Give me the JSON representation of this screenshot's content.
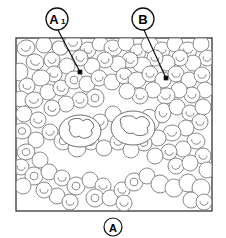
{
  "figure": {
    "type": "scientific-illustration",
    "background_color": "#ffffff",
    "cell_outline_color": "#808080",
    "frame_color": "#222222",
    "label_color": "#000000",
    "frame": {
      "x": 16,
      "y": 38,
      "width": 196,
      "height": 173,
      "stroke_width": 1.2
    }
  },
  "labels": {
    "top_left": {
      "name": "A1",
      "text": "A",
      "subscript": "1",
      "circle": {
        "cx": 57,
        "cy": 19,
        "r": 11
      },
      "leader": {
        "x1": 58,
        "y1": 30,
        "x2": 80,
        "y2": 72
      },
      "dot": {
        "cx": 80,
        "cy": 72,
        "r": 1.8
      }
    },
    "top_right": {
      "name": "B",
      "text": "B",
      "subscript": "",
      "circle": {
        "cx": 143,
        "cy": 19,
        "r": 11
      },
      "leader": {
        "x1": 144,
        "y1": 30,
        "x2": 166,
        "y2": 78
      },
      "dot": {
        "cx": 166,
        "cy": 78,
        "r": 1.8
      }
    },
    "bottom_center": {
      "name": "A",
      "text": "A",
      "subscript": "",
      "circle": {
        "cx": 113,
        "cy": 227,
        "r": 9
      },
      "leader": null,
      "dot": null
    }
  },
  "cells": {
    "erythrocytes": [
      {
        "cx": 26,
        "cy": 48,
        "rx": 9,
        "ry": 8,
        "rot": -12,
        "pallor": "arc"
      },
      {
        "cx": 44,
        "cy": 45,
        "rx": 8,
        "ry": 8,
        "rot": 5,
        "pallor": "none"
      },
      {
        "cx": 35,
        "cy": 62,
        "rx": 9,
        "ry": 8,
        "rot": 18,
        "pallor": "arc"
      },
      {
        "cx": 20,
        "cy": 72,
        "rx": 8,
        "ry": 9,
        "rot": 0,
        "pallor": "none"
      },
      {
        "cx": 52,
        "cy": 60,
        "rx": 8,
        "ry": 8,
        "rot": -8,
        "pallor": "arc"
      },
      {
        "cx": 60,
        "cy": 48,
        "rx": 8,
        "ry": 7,
        "rot": 22,
        "pallor": "none"
      },
      {
        "cx": 73,
        "cy": 43,
        "rx": 9,
        "ry": 8,
        "rot": -5,
        "pallor": "arc"
      },
      {
        "cx": 88,
        "cy": 50,
        "rx": 8,
        "ry": 8,
        "rot": 12,
        "pallor": "arc"
      },
      {
        "cx": 100,
        "cy": 44,
        "rx": 8,
        "ry": 7,
        "rot": -15,
        "pallor": "none"
      },
      {
        "cx": 113,
        "cy": 48,
        "rx": 9,
        "ry": 8,
        "rot": 8,
        "pallor": "arc"
      },
      {
        "cx": 126,
        "cy": 43,
        "rx": 8,
        "ry": 8,
        "rot": 0,
        "pallor": "none"
      },
      {
        "cx": 138,
        "cy": 52,
        "rx": 8,
        "ry": 8,
        "rot": -10,
        "pallor": "arc"
      },
      {
        "cx": 150,
        "cy": 45,
        "rx": 9,
        "ry": 8,
        "rot": 15,
        "pallor": "none"
      },
      {
        "cx": 162,
        "cy": 50,
        "rx": 8,
        "ry": 8,
        "rot": 4,
        "pallor": "arc"
      },
      {
        "cx": 175,
        "cy": 44,
        "rx": 8,
        "ry": 8,
        "rot": -6,
        "pallor": "none"
      },
      {
        "cx": 188,
        "cy": 50,
        "rx": 9,
        "ry": 8,
        "rot": 10,
        "pallor": "arc"
      },
      {
        "cx": 201,
        "cy": 44,
        "rx": 8,
        "ry": 8,
        "rot": 0,
        "pallor": "none"
      },
      {
        "cx": 207,
        "cy": 58,
        "rx": 8,
        "ry": 8,
        "rot": 12,
        "pallor": "arc"
      },
      {
        "cx": 193,
        "cy": 63,
        "rx": 8,
        "ry": 8,
        "rot": -9,
        "pallor": "none"
      },
      {
        "cx": 180,
        "cy": 58,
        "rx": 8,
        "ry": 8,
        "rot": 6,
        "pallor": "arc"
      },
      {
        "cx": 167,
        "cy": 63,
        "rx": 8,
        "ry": 8,
        "rot": -14,
        "pallor": "none"
      },
      {
        "cx": 155,
        "cy": 58,
        "rx": 8,
        "ry": 8,
        "rot": 3,
        "pallor": "arc"
      },
      {
        "cx": 142,
        "cy": 65,
        "rx": 9,
        "ry": 8,
        "rot": -4,
        "pallor": "none"
      },
      {
        "cx": 130,
        "cy": 60,
        "rx": 8,
        "ry": 8,
        "rot": 16,
        "pallor": "arc"
      },
      {
        "cx": 118,
        "cy": 64,
        "rx": 8,
        "ry": 8,
        "rot": 0,
        "pallor": "none"
      },
      {
        "cx": 105,
        "cy": 60,
        "rx": 8,
        "ry": 8,
        "rot": -11,
        "pallor": "arc"
      },
      {
        "cx": 92,
        "cy": 66,
        "rx": 8,
        "ry": 8,
        "rot": 7,
        "pallor": "none"
      },
      {
        "cx": 80,
        "cy": 58,
        "rx": 8,
        "ry": 8,
        "rot": 20,
        "pallor": "arc"
      },
      {
        "cx": 67,
        "cy": 66,
        "rx": 8,
        "ry": 8,
        "rot": -3,
        "pallor": "none"
      },
      {
        "cx": 54,
        "cy": 74,
        "rx": 8,
        "ry": 8,
        "rot": 9,
        "pallor": "arc"
      },
      {
        "cx": 41,
        "cy": 78,
        "rx": 9,
        "ry": 8,
        "rot": -7,
        "pallor": "none"
      },
      {
        "cx": 27,
        "cy": 86,
        "rx": 8,
        "ry": 8,
        "rot": 14,
        "pallor": "arc"
      },
      {
        "cx": 21,
        "cy": 99,
        "rx": 8,
        "ry": 8,
        "rot": 0,
        "pallor": "none"
      },
      {
        "cx": 34,
        "cy": 100,
        "rx": 9,
        "ry": 8,
        "rot": -12,
        "pallor": "arc"
      },
      {
        "cx": 48,
        "cy": 92,
        "rx": 8,
        "ry": 8,
        "rot": 5,
        "pallor": "none"
      },
      {
        "cx": 61,
        "cy": 88,
        "rx": 8,
        "ry": 8,
        "rot": 18,
        "pallor": "arc"
      },
      {
        "cx": 74,
        "cy": 80,
        "rx": 9,
        "ry": 9,
        "rot": -5,
        "pallor": "ring"
      },
      {
        "cx": 87,
        "cy": 84,
        "rx": 8,
        "ry": 8,
        "rot": 11,
        "pallor": "none"
      },
      {
        "cx": 99,
        "cy": 78,
        "rx": 8,
        "ry": 8,
        "rot": -9,
        "pallor": "arc"
      },
      {
        "cx": 112,
        "cy": 82,
        "rx": 8,
        "ry": 8,
        "rot": 2,
        "pallor": "none"
      },
      {
        "cx": 124,
        "cy": 76,
        "rx": 8,
        "ry": 8,
        "rot": 15,
        "pallor": "arc"
      },
      {
        "cx": 137,
        "cy": 80,
        "rx": 9,
        "ry": 8,
        "rot": -6,
        "pallor": "none"
      },
      {
        "cx": 150,
        "cy": 74,
        "rx": 8,
        "ry": 8,
        "rot": 8,
        "pallor": "arc"
      },
      {
        "cx": 163,
        "cy": 80,
        "rx": 8,
        "ry": 8,
        "rot": -13,
        "pallor": "none"
      },
      {
        "cx": 176,
        "cy": 74,
        "rx": 8,
        "ry": 8,
        "rot": 4,
        "pallor": "arc"
      },
      {
        "cx": 189,
        "cy": 80,
        "rx": 8,
        "ry": 8,
        "rot": 17,
        "pallor": "none"
      },
      {
        "cx": 202,
        "cy": 75,
        "rx": 8,
        "ry": 8,
        "rot": -2,
        "pallor": "arc"
      },
      {
        "cx": 205,
        "cy": 90,
        "rx": 8,
        "ry": 8,
        "rot": 10,
        "pallor": "none"
      },
      {
        "cx": 192,
        "cy": 95,
        "rx": 8,
        "ry": 8,
        "rot": -8,
        "pallor": "arc"
      },
      {
        "cx": 179,
        "cy": 90,
        "rx": 8,
        "ry": 8,
        "rot": 6,
        "pallor": "none"
      },
      {
        "cx": 166,
        "cy": 96,
        "rx": 9,
        "ry": 8,
        "rot": -15,
        "pallor": "arc"
      },
      {
        "cx": 153,
        "cy": 90,
        "rx": 8,
        "ry": 8,
        "rot": 3,
        "pallor": "none"
      },
      {
        "cx": 140,
        "cy": 96,
        "rx": 8,
        "ry": 8,
        "rot": 12,
        "pallor": "arc"
      },
      {
        "cx": 127,
        "cy": 91,
        "rx": 8,
        "ry": 8,
        "rot": -4,
        "pallor": "none"
      },
      {
        "cx": 95,
        "cy": 98,
        "rx": 9,
        "ry": 9,
        "rot": 7,
        "pallor": "ring"
      },
      {
        "cx": 80,
        "cy": 100,
        "rx": 8,
        "ry": 8,
        "rot": -10,
        "pallor": "arc"
      },
      {
        "cx": 66,
        "cy": 104,
        "rx": 8,
        "ry": 8,
        "rot": 5,
        "pallor": "none"
      },
      {
        "cx": 52,
        "cy": 108,
        "rx": 8,
        "ry": 8,
        "rot": 19,
        "pallor": "arc"
      },
      {
        "cx": 24,
        "cy": 114,
        "rx": 8,
        "ry": 8,
        "rot": -6,
        "pallor": "none"
      },
      {
        "cx": 38,
        "cy": 120,
        "rx": 8,
        "ry": 8,
        "rot": 9,
        "pallor": "arc"
      },
      {
        "cx": 22,
        "cy": 131,
        "rx": 9,
        "ry": 8,
        "rot": 0,
        "pallor": "ring"
      },
      {
        "cx": 36,
        "cy": 140,
        "rx": 8,
        "ry": 8,
        "rot": 13,
        "pallor": "none"
      },
      {
        "cx": 50,
        "cy": 132,
        "rx": 8,
        "ry": 8,
        "rot": -7,
        "pallor": "arc"
      },
      {
        "cx": 63,
        "cy": 141,
        "rx": 9,
        "ry": 9,
        "rot": 4,
        "pallor": "ring"
      },
      {
        "cx": 77,
        "cy": 148,
        "rx": 9,
        "ry": 9,
        "rot": -11,
        "pallor": "none"
      },
      {
        "cx": 91,
        "cy": 142,
        "rx": 8,
        "ry": 8,
        "rot": 6,
        "pallor": "arc"
      },
      {
        "cx": 104,
        "cy": 148,
        "rx": 8,
        "ry": 8,
        "rot": 16,
        "pallor": "none"
      },
      {
        "cx": 118,
        "cy": 142,
        "rx": 8,
        "ry": 8,
        "rot": -3,
        "pallor": "arc"
      },
      {
        "cx": 150,
        "cy": 120,
        "rx": 9,
        "ry": 11,
        "rot": -20,
        "pallor": "none"
      },
      {
        "cx": 163,
        "cy": 113,
        "rx": 8,
        "ry": 10,
        "rot": 12,
        "pallor": "arc"
      },
      {
        "cx": 177,
        "cy": 107,
        "rx": 8,
        "ry": 8,
        "rot": -5,
        "pallor": "none"
      },
      {
        "cx": 190,
        "cy": 113,
        "rx": 8,
        "ry": 8,
        "rot": 8,
        "pallor": "arc"
      },
      {
        "cx": 203,
        "cy": 107,
        "rx": 8,
        "ry": 8,
        "rot": -12,
        "pallor": "none"
      },
      {
        "cx": 200,
        "cy": 122,
        "rx": 8,
        "ry": 8,
        "rot": 3,
        "pallor": "arc"
      },
      {
        "cx": 186,
        "cy": 128,
        "rx": 8,
        "ry": 8,
        "rot": 14,
        "pallor": "none"
      },
      {
        "cx": 172,
        "cy": 133,
        "rx": 9,
        "ry": 8,
        "rot": -8,
        "pallor": "arc"
      },
      {
        "cx": 158,
        "cy": 138,
        "rx": 8,
        "ry": 8,
        "rot": 5,
        "pallor": "none"
      },
      {
        "cx": 144,
        "cy": 143,
        "rx": 8,
        "ry": 8,
        "rot": -15,
        "pallor": "arc"
      },
      {
        "cx": 131,
        "cy": 150,
        "rx": 8,
        "ry": 8,
        "rot": 2,
        "pallor": "none"
      },
      {
        "cx": 196,
        "cy": 141,
        "rx": 9,
        "ry": 8,
        "rot": 10,
        "pallor": "arc"
      },
      {
        "cx": 183,
        "cy": 149,
        "rx": 8,
        "ry": 8,
        "rot": -4,
        "pallor": "none"
      },
      {
        "cx": 169,
        "cy": 152,
        "rx": 8,
        "ry": 8,
        "rot": 17,
        "pallor": "arc"
      },
      {
        "cx": 155,
        "cy": 156,
        "rx": 8,
        "ry": 8,
        "rot": -9,
        "pallor": "none"
      },
      {
        "cx": 203,
        "cy": 156,
        "rx": 8,
        "ry": 8,
        "rot": 6,
        "pallor": "arc"
      },
      {
        "cx": 26,
        "cy": 152,
        "rx": 9,
        "ry": 8,
        "rot": -13,
        "pallor": "ring"
      },
      {
        "cx": 40,
        "cy": 160,
        "rx": 8,
        "ry": 8,
        "rot": 4,
        "pallor": "none"
      },
      {
        "cx": 21,
        "cy": 167,
        "rx": 8,
        "ry": 8,
        "rot": 11,
        "pallor": "arc"
      },
      {
        "cx": 34,
        "cy": 176,
        "rx": 9,
        "ry": 9,
        "rot": -6,
        "pallor": "ring"
      },
      {
        "cx": 49,
        "cy": 172,
        "rx": 8,
        "ry": 8,
        "rot": 8,
        "pallor": "none"
      },
      {
        "cx": 62,
        "cy": 178,
        "rx": 8,
        "ry": 8,
        "rot": -2,
        "pallor": "arc"
      },
      {
        "cx": 76,
        "cy": 186,
        "rx": 9,
        "ry": 9,
        "rot": 15,
        "pallor": "ring"
      },
      {
        "cx": 90,
        "cy": 180,
        "rx": 8,
        "ry": 8,
        "rot": -10,
        "pallor": "none"
      },
      {
        "cx": 103,
        "cy": 186,
        "rx": 8,
        "ry": 8,
        "rot": 3,
        "pallor": "arc"
      },
      {
        "cx": 95,
        "cy": 198,
        "rx": 9,
        "ry": 9,
        "rot": 9,
        "pallor": "ring"
      },
      {
        "cx": 110,
        "cy": 198,
        "rx": 8,
        "ry": 8,
        "rot": -5,
        "pallor": "none"
      },
      {
        "cx": 122,
        "cy": 190,
        "rx": 8,
        "ry": 8,
        "rot": 12,
        "pallor": "arc"
      },
      {
        "cx": 134,
        "cy": 182,
        "rx": 9,
        "ry": 9,
        "rot": -7,
        "pallor": "ring"
      },
      {
        "cx": 147,
        "cy": 176,
        "rx": 8,
        "ry": 8,
        "rot": 5,
        "pallor": "none"
      },
      {
        "cx": 160,
        "cy": 184,
        "rx": 9,
        "ry": 9,
        "rot": 18,
        "pallor": "none"
      },
      {
        "cx": 174,
        "cy": 188,
        "rx": 9,
        "ry": 9,
        "rot": -3,
        "pallor": "none"
      },
      {
        "cx": 188,
        "cy": 183,
        "rx": 9,
        "ry": 9,
        "rot": 7,
        "pallor": "none"
      },
      {
        "cx": 201,
        "cy": 188,
        "rx": 9,
        "ry": 9,
        "rot": -11,
        "pallor": "none"
      },
      {
        "cx": 124,
        "cy": 203,
        "rx": 8,
        "ry": 8,
        "rot": 4,
        "pallor": "arc"
      },
      {
        "cx": 57,
        "cy": 196,
        "rx": 8,
        "ry": 8,
        "rot": -14,
        "pallor": "none"
      },
      {
        "cx": 44,
        "cy": 190,
        "rx": 8,
        "ry": 8,
        "rot": 6,
        "pallor": "arc"
      },
      {
        "cx": 23,
        "cy": 186,
        "rx": 8,
        "ry": 8,
        "rot": 0,
        "pallor": "none"
      },
      {
        "cx": 70,
        "cy": 202,
        "rx": 8,
        "ry": 8,
        "rot": 13,
        "pallor": "arc"
      },
      {
        "cx": 191,
        "cy": 200,
        "rx": 8,
        "ry": 8,
        "rot": -8,
        "pallor": "none"
      },
      {
        "cx": 204,
        "cy": 202,
        "rx": 8,
        "ry": 8,
        "rot": 5,
        "pallor": "arc"
      },
      {
        "cx": 113,
        "cy": 114,
        "rx": 8,
        "ry": 8,
        "rot": -9,
        "pallor": "none"
      },
      {
        "cx": 100,
        "cy": 122,
        "rx": 8,
        "ry": 8,
        "rot": 3,
        "pallor": "arc"
      },
      {
        "cx": 207,
        "cy": 170,
        "rx": 8,
        "ry": 8,
        "rot": 10,
        "pallor": "none"
      },
      {
        "cx": 176,
        "cy": 166,
        "rx": 8,
        "ry": 8,
        "rot": -6,
        "pallor": "arc"
      },
      {
        "cx": 190,
        "cy": 163,
        "rx": 8,
        "ry": 8,
        "rot": 2,
        "pallor": "none"
      }
    ],
    "leukocytes": [
      {
        "id": "wbc-left",
        "cx": 80,
        "cy": 131,
        "rx": 21,
        "ry": 16,
        "nucleus_path": "M70,127 q-4,-6 3,-8 q7,-2 10,2 q5,-4 9,1 q4,5 -1,8 q3,4 -2,7 q-6,3 -10,-1 q-5,3 -8,-2 q-3,-4 -1,-7 z"
      },
      {
        "id": "wbc-right",
        "cx": 133,
        "cy": 128,
        "rx": 22,
        "ry": 17,
        "nucleus_path": "M121,124 q-3,-7 5,-8 q8,-1 10,3 q6,-5 11,0 q5,5 0,9 q3,5 -3,7 q-7,2 -11,-2 q-6,2 -9,-3 q-4,-4 -3,-6 z"
      }
    ]
  }
}
